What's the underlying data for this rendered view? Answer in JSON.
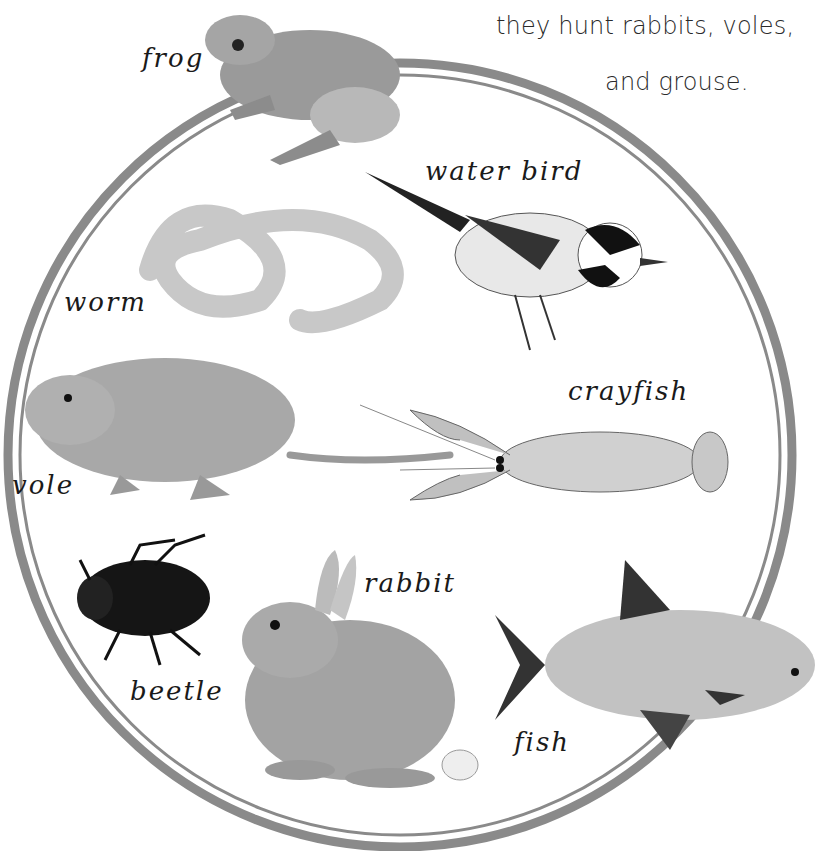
{
  "caption": {
    "line1": "they hunt rabbits, voles,",
    "line2": "and grouse."
  },
  "diagram": {
    "type": "prey-circle",
    "ring_color": "#8a8a8a",
    "animals": [
      {
        "id": "frog",
        "label": "frog"
      },
      {
        "id": "water-bird",
        "label": "water bird"
      },
      {
        "id": "worm",
        "label": "worm"
      },
      {
        "id": "vole",
        "label": "vole"
      },
      {
        "id": "crayfish",
        "label": "crayfish"
      },
      {
        "id": "beetle",
        "label": "beetle"
      },
      {
        "id": "rabbit",
        "label": "rabbit"
      },
      {
        "id": "fish",
        "label": "fish"
      }
    ]
  }
}
